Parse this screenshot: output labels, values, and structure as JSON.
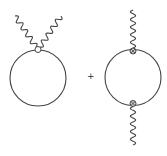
{
  "diagram": {
    "operator": "+",
    "colors": {
      "line": "#444444",
      "background": "#ffffff",
      "vertex_fill": "#cccccc"
    },
    "terms": [
      {
        "name": "seagull-loop",
        "loop": "closed scalar loop",
        "vertices": [
          {
            "type": "four-point (seagull) vertex",
            "style": "open circle",
            "attached_photons": 2
          }
        ],
        "external_lines": [
          {
            "type": "photon",
            "style": "wavy",
            "direction": "up-left"
          },
          {
            "type": "photon",
            "style": "wavy",
            "direction": "up-right"
          }
        ]
      },
      {
        "name": "bubble-loop",
        "loop": "closed scalar loop",
        "vertices": [
          {
            "type": "three-point vertex",
            "style": "crossed circle",
            "position": "top"
          },
          {
            "type": "three-point vertex",
            "style": "crossed circle",
            "position": "bottom"
          }
        ],
        "external_lines": [
          {
            "type": "photon",
            "style": "wavy",
            "direction": "up"
          },
          {
            "type": "photon",
            "style": "wavy",
            "direction": "down"
          }
        ]
      }
    ]
  }
}
